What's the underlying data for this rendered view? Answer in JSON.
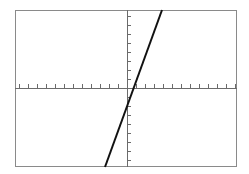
{
  "app": {
    "title": "Coordinate Plane Graph",
    "background_color": "#ffffff"
  },
  "plot": {
    "frame": {
      "name": "plot-frame",
      "left_px": 15,
      "top_px": 10,
      "width_px": 222,
      "height_px": 157,
      "border_color": "#8a8a8a",
      "border_width_px": 1,
      "fill_color": "#ffffff"
    },
    "axes": {
      "color": "#6b6b6b",
      "line_width_px": 1,
      "x_axis_y_px": 88,
      "y_axis_x_px": 127,
      "tick_length_px": 4,
      "tick_spacing_px": 9,
      "tick_color": "#6b6b6b",
      "x_tick_count": 24,
      "y_tick_count": 17,
      "origin_label": "",
      "x_label": "",
      "y_label": ""
    },
    "curve": {
      "name": "linear-function-line",
      "color": "#111111",
      "line_width_px": 2,
      "x1_px": 105,
      "y1_px": 167,
      "x2_px": 162,
      "y2_px": 10
    }
  },
  "chart_data": {
    "type": "line",
    "title": "",
    "subtitle": "",
    "xlabel": "x",
    "ylabel": "y",
    "grid": false,
    "legend": "none",
    "axis_style": "centered-cross",
    "xlim": [
      -12.4,
      12.2
    ],
    "ylim": [
      -8.8,
      8.7
    ],
    "x_tick_step": 1,
    "y_tick_step": 1,
    "tick_labels_shown": false,
    "series": [
      {
        "name": "line",
        "equation": "y = 2.75x - 0.8",
        "slope": 2.75,
        "intercept": -0.8,
        "x_intercept": 0.29,
        "x": [
          -2.44,
          0.29,
          3.89
        ],
        "y": [
          -7.5,
          0,
          9.9
        ],
        "endpoints": {
          "bottom": {
            "x": -2.44,
            "y": -8.78
          },
          "top": {
            "x": 3.89,
            "y": 8.67
          }
        }
      }
    ],
    "annotations": []
  }
}
